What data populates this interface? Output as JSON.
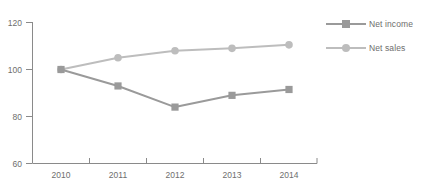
{
  "chart_data": {
    "type": "line",
    "title": "",
    "subtitle": "",
    "xlabel": "",
    "ylabel": "",
    "categories": [
      "2010",
      "2011",
      "2012",
      "2013",
      "2014"
    ],
    "series": [
      {
        "name": "Net income",
        "values": [
          100,
          93,
          84,
          89,
          91.5
        ],
        "color": "#9a9a9a",
        "marker": "square"
      },
      {
        "name": "Net sales",
        "values": [
          100,
          105,
          108,
          109,
          110.5
        ],
        "color": "#bdbdbd",
        "marker": "circle"
      }
    ],
    "ylim": [
      60,
      120
    ],
    "yticks": [
      60,
      80,
      100,
      120
    ],
    "ytick_labels": [
      "60",
      "80",
      "100",
      "120"
    ],
    "xtick_labels": [
      "2010",
      "2011",
      "2012",
      "2013",
      "2014"
    ],
    "grid": false,
    "legend_position": "right",
    "axis_color": "#8a8a8a"
  },
  "legend": {
    "entries": [
      {
        "label": "Net income"
      },
      {
        "label": "Net sales"
      }
    ]
  },
  "axes": {
    "y_labels": [
      "120",
      "100",
      "80",
      "60"
    ],
    "x_labels": [
      "2010",
      "2011",
      "2012",
      "2013",
      "2014"
    ]
  }
}
